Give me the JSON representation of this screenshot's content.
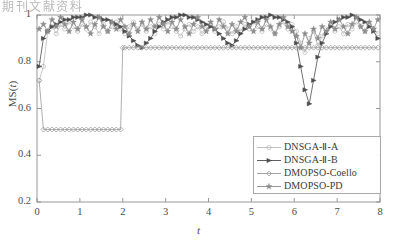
{
  "header": {
    "text": "期刊文献资料",
    "page_number": ""
  },
  "chart_data": {
    "type": "line",
    "title": "",
    "xlabel": "t",
    "ylabel": "MS(t)",
    "xlim": [
      0,
      8
    ],
    "ylim": [
      0.2,
      1.0
    ],
    "xticks": [
      "0",
      "1",
      "2",
      "3",
      "4",
      "5",
      "6",
      "7",
      "8"
    ],
    "xtick_values": [
      0,
      1,
      2,
      3,
      4,
      5,
      6,
      7,
      8
    ],
    "yticks": [
      "0.2",
      "0.4",
      "0.6",
      "0.8",
      "1"
    ],
    "ytick_values": [
      0.2,
      0.4,
      0.6,
      0.8,
      1.0
    ],
    "grid": false,
    "legend_position": "lower right",
    "series": [
      {
        "name": "DNSGA-Ⅱ-A",
        "marker": "circle-open",
        "color": "#b9b9b9",
        "x": [
          0.05,
          0.15,
          0.25,
          0.35,
          0.45,
          0.55,
          0.65,
          0.75,
          0.85,
          0.95,
          1.05,
          1.15,
          1.25,
          1.35,
          1.45,
          1.55,
          1.65,
          1.75,
          1.85,
          1.95,
          2.05,
          2.15,
          2.25,
          2.35,
          2.45,
          2.55,
          2.65,
          2.75,
          2.85,
          2.95,
          3.05,
          3.15,
          3.25,
          3.35,
          3.45,
          3.55,
          3.65,
          3.75,
          3.85,
          3.95,
          4.05,
          4.15,
          4.25,
          4.35,
          4.45,
          4.55,
          4.65,
          4.75,
          4.85,
          4.95,
          5.05,
          5.15,
          5.25,
          5.35,
          5.45,
          5.55,
          5.65,
          5.75,
          5.85,
          5.95,
          6.05,
          6.15,
          6.25,
          6.35,
          6.45,
          6.55,
          6.65,
          6.75,
          6.85,
          6.95,
          7.05,
          7.15,
          7.25,
          7.35,
          7.45,
          7.55,
          7.65,
          7.75,
          7.85,
          7.95
        ],
        "values": [
          0.72,
          0.78,
          0.93,
          0.95,
          0.92,
          0.96,
          0.94,
          0.97,
          0.95,
          0.93,
          0.96,
          0.94,
          0.97,
          0.95,
          0.92,
          0.96,
          0.93,
          0.95,
          0.97,
          0.94,
          0.92,
          0.95,
          0.97,
          0.94,
          0.96,
          0.93,
          0.95,
          0.92,
          0.96,
          0.94,
          0.97,
          0.95,
          0.93,
          0.91,
          0.94,
          0.96,
          0.93,
          0.95,
          0.92,
          0.94,
          0.96,
          0.93,
          0.95,
          0.97,
          0.94,
          0.92,
          0.95,
          0.93,
          0.96,
          0.94,
          0.97,
          0.95,
          0.93,
          0.96,
          0.94,
          0.92,
          0.95,
          0.97,
          0.94,
          0.96,
          0.93,
          0.88,
          0.84,
          0.9,
          0.93,
          0.87,
          0.91,
          0.94,
          0.96,
          0.93,
          0.95,
          0.92,
          0.96,
          0.94,
          0.97,
          0.95,
          0.93,
          0.96,
          0.94,
          0.92
        ]
      },
      {
        "name": "DNSGA-Ⅱ-B",
        "marker": "triangle-right-filled",
        "color": "#4d4d4d",
        "x": [
          0.05,
          0.15,
          0.25,
          0.35,
          0.45,
          0.55,
          0.65,
          0.75,
          0.85,
          0.95,
          1.05,
          1.15,
          1.25,
          1.35,
          1.45,
          1.55,
          1.65,
          1.75,
          1.85,
          1.95,
          2.05,
          2.15,
          2.25,
          2.35,
          2.45,
          2.55,
          2.65,
          2.75,
          2.85,
          2.95,
          3.05,
          3.15,
          3.25,
          3.35,
          3.45,
          3.55,
          3.65,
          3.75,
          3.85,
          3.95,
          4.05,
          4.15,
          4.25,
          4.35,
          4.45,
          4.55,
          4.65,
          4.75,
          4.85,
          4.95,
          5.05,
          5.15,
          5.25,
          5.35,
          5.45,
          5.55,
          5.65,
          5.75,
          5.85,
          5.95,
          6.05,
          6.15,
          6.25,
          6.35,
          6.45,
          6.55,
          6.65,
          6.75,
          6.85,
          6.95,
          7.05,
          7.15,
          7.25,
          7.35,
          7.45,
          7.55,
          7.65,
          7.75,
          7.85,
          7.95
        ],
        "values": [
          0.78,
          0.9,
          0.93,
          0.95,
          0.96,
          0.97,
          0.98,
          0.98,
          0.99,
          0.99,
          0.99,
          1.0,
          1.0,
          0.99,
          0.99,
          0.98,
          0.98,
          0.97,
          0.96,
          0.95,
          0.93,
          0.91,
          0.89,
          0.87,
          0.86,
          0.88,
          0.9,
          0.93,
          0.95,
          0.97,
          0.98,
          0.99,
          0.99,
          1.0,
          1.0,
          0.99,
          0.99,
          0.98,
          0.97,
          0.96,
          0.95,
          0.94,
          0.92,
          0.9,
          0.88,
          0.87,
          0.89,
          0.92,
          0.94,
          0.96,
          0.97,
          0.98,
          0.99,
          0.99,
          1.0,
          0.99,
          0.99,
          0.98,
          0.97,
          0.95,
          0.88,
          0.78,
          0.68,
          0.62,
          0.72,
          0.82,
          0.88,
          0.92,
          0.95,
          0.97,
          0.98,
          0.99,
          0.99,
          1.0,
          0.99,
          0.98,
          0.97,
          0.95,
          0.93,
          0.9
        ]
      },
      {
        "name": "DMOPSO-Coello",
        "marker": "diamond-open",
        "color": "#9a9a9a",
        "x": [
          0.05,
          0.15,
          0.25,
          0.35,
          0.45,
          0.55,
          0.65,
          0.75,
          0.85,
          0.95,
          1.05,
          1.15,
          1.25,
          1.35,
          1.45,
          1.55,
          1.65,
          1.75,
          1.85,
          1.95,
          2.0,
          2.05,
          2.15,
          2.25,
          2.35,
          2.45,
          2.55,
          2.65,
          2.75,
          2.85,
          2.95,
          3.05,
          3.15,
          3.25,
          3.35,
          3.45,
          3.55,
          3.65,
          3.75,
          3.85,
          3.95,
          4.05,
          4.15,
          4.25,
          4.35,
          4.45,
          4.55,
          4.65,
          4.75,
          4.85,
          4.95,
          5.05,
          5.15,
          5.25,
          5.35,
          5.45,
          5.55,
          5.65,
          5.75,
          5.85,
          5.95,
          6.05,
          6.15,
          6.25,
          6.35,
          6.45,
          6.55,
          6.65,
          6.75,
          6.85,
          6.95,
          7.05,
          7.15,
          7.25,
          7.35,
          7.45,
          7.55,
          7.65,
          7.75,
          7.85,
          7.95
        ],
        "values": [
          0.72,
          0.51,
          0.51,
          0.51,
          0.51,
          0.51,
          0.51,
          0.51,
          0.51,
          0.51,
          0.51,
          0.51,
          0.51,
          0.51,
          0.51,
          0.51,
          0.51,
          0.51,
          0.51,
          0.51,
          0.86,
          0.86,
          0.86,
          0.86,
          0.86,
          0.86,
          0.86,
          0.86,
          0.86,
          0.86,
          0.86,
          0.86,
          0.86,
          0.86,
          0.86,
          0.86,
          0.86,
          0.86,
          0.86,
          0.86,
          0.86,
          0.86,
          0.86,
          0.86,
          0.86,
          0.86,
          0.86,
          0.86,
          0.86,
          0.86,
          0.86,
          0.86,
          0.86,
          0.86,
          0.86,
          0.86,
          0.86,
          0.86,
          0.86,
          0.86,
          0.86,
          0.86,
          0.86,
          0.86,
          0.86,
          0.86,
          0.86,
          0.86,
          0.86,
          0.86,
          0.86,
          0.86,
          0.86,
          0.86,
          0.86,
          0.86,
          0.86,
          0.86,
          0.86,
          0.86,
          0.86
        ]
      },
      {
        "name": "DMOPSO-PD",
        "marker": "star-filled",
        "color": "#8c8c8c",
        "x": [
          0.05,
          0.15,
          0.25,
          0.35,
          0.45,
          0.55,
          0.65,
          0.75,
          0.85,
          0.95,
          1.05,
          1.15,
          1.25,
          1.35,
          1.45,
          1.55,
          1.65,
          1.75,
          1.85,
          1.95,
          2.05,
          2.15,
          2.25,
          2.35,
          2.45,
          2.55,
          2.65,
          2.75,
          2.85,
          2.95,
          3.05,
          3.15,
          3.25,
          3.35,
          3.45,
          3.55,
          3.65,
          3.75,
          3.85,
          3.95,
          4.05,
          4.15,
          4.25,
          4.35,
          4.45,
          4.55,
          4.65,
          4.75,
          4.85,
          4.95,
          5.05,
          5.15,
          5.25,
          5.35,
          5.45,
          5.55,
          5.65,
          5.75,
          5.85,
          5.95,
          6.05,
          6.15,
          6.25,
          6.35,
          6.45,
          6.55,
          6.65,
          6.75,
          6.85,
          6.95,
          7.05,
          7.15,
          7.25,
          7.35,
          7.45,
          7.55,
          7.65,
          7.75,
          7.85,
          7.95
        ],
        "values": [
          0.94,
          0.96,
          0.93,
          0.98,
          0.95,
          0.99,
          0.96,
          0.93,
          0.97,
          0.94,
          0.98,
          0.95,
          0.92,
          0.96,
          0.99,
          0.95,
          0.93,
          0.97,
          0.94,
          0.98,
          0.95,
          0.92,
          0.96,
          0.93,
          0.97,
          0.94,
          0.98,
          0.95,
          0.99,
          0.96,
          0.93,
          0.97,
          0.94,
          0.98,
          0.95,
          0.92,
          0.96,
          0.99,
          0.95,
          0.93,
          0.97,
          0.94,
          0.98,
          0.95,
          0.92,
          0.96,
          0.93,
          0.97,
          0.99,
          0.95,
          0.93,
          0.97,
          0.94,
          0.98,
          0.95,
          0.92,
          0.96,
          0.99,
          0.95,
          0.93,
          0.91,
          0.86,
          0.92,
          0.88,
          0.94,
          0.9,
          0.95,
          0.93,
          0.97,
          0.94,
          0.98,
          0.95,
          0.92,
          0.96,
          0.99,
          0.95,
          0.93,
          0.97,
          0.94,
          0.98
        ]
      }
    ],
    "legend_entries": [
      "DNSGA-Ⅱ-A",
      "DNSGA-Ⅱ-B",
      "DMOPSO-Coello",
      "DMOPSO-PD"
    ]
  }
}
